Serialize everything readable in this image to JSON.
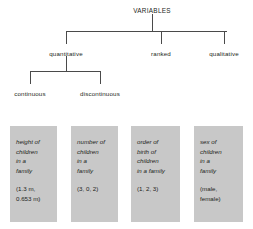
{
  "diagram": {
    "title": "VARIABLES",
    "root": {
      "label": "VARIABLES",
      "x": 152,
      "y": 8
    },
    "level1": [
      {
        "label": "quantitative",
        "x": 66,
        "y": 51
      },
      {
        "label": "ranked",
        "x": 161,
        "y": 51
      },
      {
        "label": "qualitative",
        "x": 224,
        "y": 51
      }
    ],
    "level2": [
      {
        "label": "continuous",
        "x": 30,
        "y": 91
      },
      {
        "label": "discontinuous",
        "x": 100,
        "y": 91
      }
    ],
    "examples": [
      {
        "name": "height-of-children",
        "lines": [
          "height of",
          "children",
          "in a",
          "family"
        ],
        "values": [
          "(1.3 m,",
          "0.653 m)"
        ],
        "x": 10,
        "width": 47
      },
      {
        "name": "number-of-children",
        "lines": [
          "number of",
          "children",
          "in a",
          "family"
        ],
        "values": [
          "(3, 0, 2)"
        ],
        "x": 71,
        "width": 47
      },
      {
        "name": "order-of-birth",
        "lines": [
          "order of",
          "birth of",
          "children",
          "in a family"
        ],
        "values": [
          "(1, 2, 3)"
        ],
        "x": 131,
        "width": 49
      },
      {
        "name": "sex-of-children",
        "lines": [
          "sex of",
          "children",
          "in a",
          "family"
        ],
        "values": [
          "(male,",
          "female)"
        ],
        "x": 194,
        "width": 49
      }
    ],
    "colors": {
      "line": "#4a4a4a",
      "box_fill": "#c8c8c8",
      "text": "#231f20"
    },
    "geometry": {
      "box_top": 126,
      "box_height": 96
    }
  }
}
